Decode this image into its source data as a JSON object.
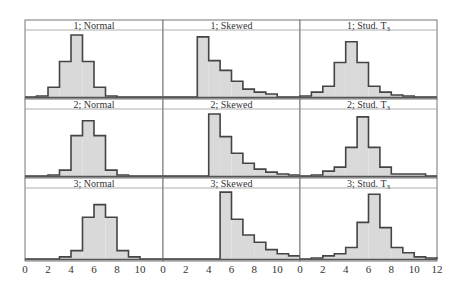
{
  "chart_data": {
    "type": "bar",
    "layout": {
      "rows": 3,
      "cols": 3,
      "shared_x": true,
      "grid": false,
      "legend": "none"
    },
    "xlabel": "",
    "ylabel": "",
    "xlim": [
      0,
      12
    ],
    "x_ticks": [
      0,
      2,
      4,
      6,
      8,
      10,
      12
    ],
    "bin_edges": [
      0,
      1,
      2,
      3,
      4,
      5,
      6,
      7,
      8,
      9,
      10,
      11,
      12
    ],
    "y_units": "relative frequency (approx., panel max ≈ 65)",
    "panels": [
      {
        "title": "1; Normal",
        "row": 1,
        "col": 1,
        "values": [
          0,
          1,
          10,
          36,
          63,
          36,
          10,
          1,
          0,
          0,
          0,
          0
        ]
      },
      {
        "title": "1; Skewed",
        "row": 1,
        "col": 2,
        "values": [
          0,
          0,
          0,
          61,
          37,
          27,
          16,
          8,
          5,
          3,
          0,
          0
        ]
      },
      {
        "title": "1; Stud. T3",
        "row": 1,
        "col": 3,
        "values": [
          1,
          5,
          11,
          35,
          56,
          35,
          11,
          5,
          2,
          1,
          0,
          0
        ]
      },
      {
        "title": "2; Normal",
        "row": 2,
        "col": 1,
        "values": [
          0,
          0,
          1,
          6,
          41,
          56,
          41,
          6,
          1,
          0,
          0,
          0
        ]
      },
      {
        "title": "2; Skewed",
        "row": 2,
        "col": 2,
        "values": [
          0,
          0,
          0,
          0,
          63,
          40,
          23,
          13,
          7,
          4,
          2,
          1
        ]
      },
      {
        "title": "2; Stud. T3",
        "row": 2,
        "col": 3,
        "values": [
          0,
          1,
          5,
          9,
          29,
          60,
          29,
          9,
          2,
          2,
          2,
          0
        ]
      },
      {
        "title": "3; Normal",
        "row": 3,
        "col": 1,
        "values": [
          0,
          0,
          0,
          2,
          8,
          40,
          52,
          40,
          8,
          2,
          0,
          0
        ]
      },
      {
        "title": "3; Skewed",
        "row": 3,
        "col": 2,
        "values": [
          0,
          0,
          0,
          0,
          0,
          64,
          38,
          23,
          16,
          9,
          5,
          3
        ]
      },
      {
        "title": "3; Stud. T3",
        "row": 3,
        "col": 3,
        "values": [
          0,
          1,
          3,
          5,
          11,
          35,
          62,
          30,
          11,
          6,
          2,
          1
        ]
      }
    ],
    "colors": {
      "fill": "#d9d9d9",
      "stroke": "#444444",
      "frame": "#777777"
    }
  },
  "axis": {
    "tick_labels": [
      "0",
      "2",
      "4",
      "6",
      "8",
      "10"
    ],
    "last_tick_label": "12"
  }
}
